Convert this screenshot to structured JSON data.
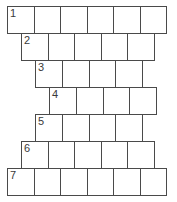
{
  "diagram": {
    "type": "crossword-brick-grid",
    "background_color": "#ffffff",
    "cell_fill_color": "#ffffff",
    "cell_border_color": "#4a4a4a",
    "number_color": "#3a3a3a",
    "canvas": {
      "width": 177,
      "height": 202
    },
    "cell_size": {
      "width": 27.5,
      "height": 27.5
    },
    "row_count": 7,
    "rows": [
      {
        "number": "1",
        "cells": 6,
        "left": 7,
        "top": 6,
        "width": 165,
        "height": 28
      },
      {
        "number": "2",
        "cells": 5,
        "left": 21,
        "top": 33,
        "width": 138,
        "height": 28
      },
      {
        "number": "3",
        "cells": 4,
        "left": 35,
        "top": 60,
        "width": 111,
        "height": 28
      },
      {
        "number": "4",
        "cells": 4,
        "left": 49,
        "top": 87,
        "width": 111,
        "height": 28
      },
      {
        "number": "5",
        "cells": 4,
        "left": 35,
        "top": 114,
        "width": 111,
        "height": 28
      },
      {
        "number": "6",
        "cells": 5,
        "left": 21,
        "top": 141,
        "width": 138,
        "height": 28
      },
      {
        "number": "7",
        "cells": 6,
        "left": 7,
        "top": 168,
        "width": 165,
        "height": 28
      }
    ]
  }
}
